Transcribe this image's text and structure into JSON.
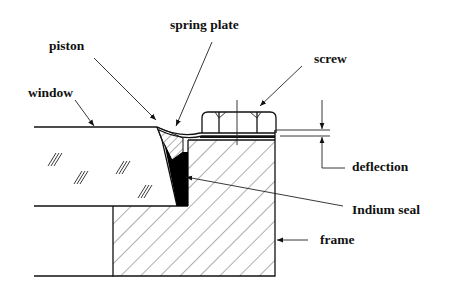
{
  "diagram": {
    "labels": {
      "piston": "piston",
      "spring_plate": "spring plate",
      "screw": "screw",
      "window": "window",
      "deflection": "deflection",
      "indium_seal": "Indium seal",
      "frame": "frame"
    },
    "colors": {
      "ink": "#111111",
      "background": "#ffffff",
      "seal_fill": "#000000"
    }
  }
}
